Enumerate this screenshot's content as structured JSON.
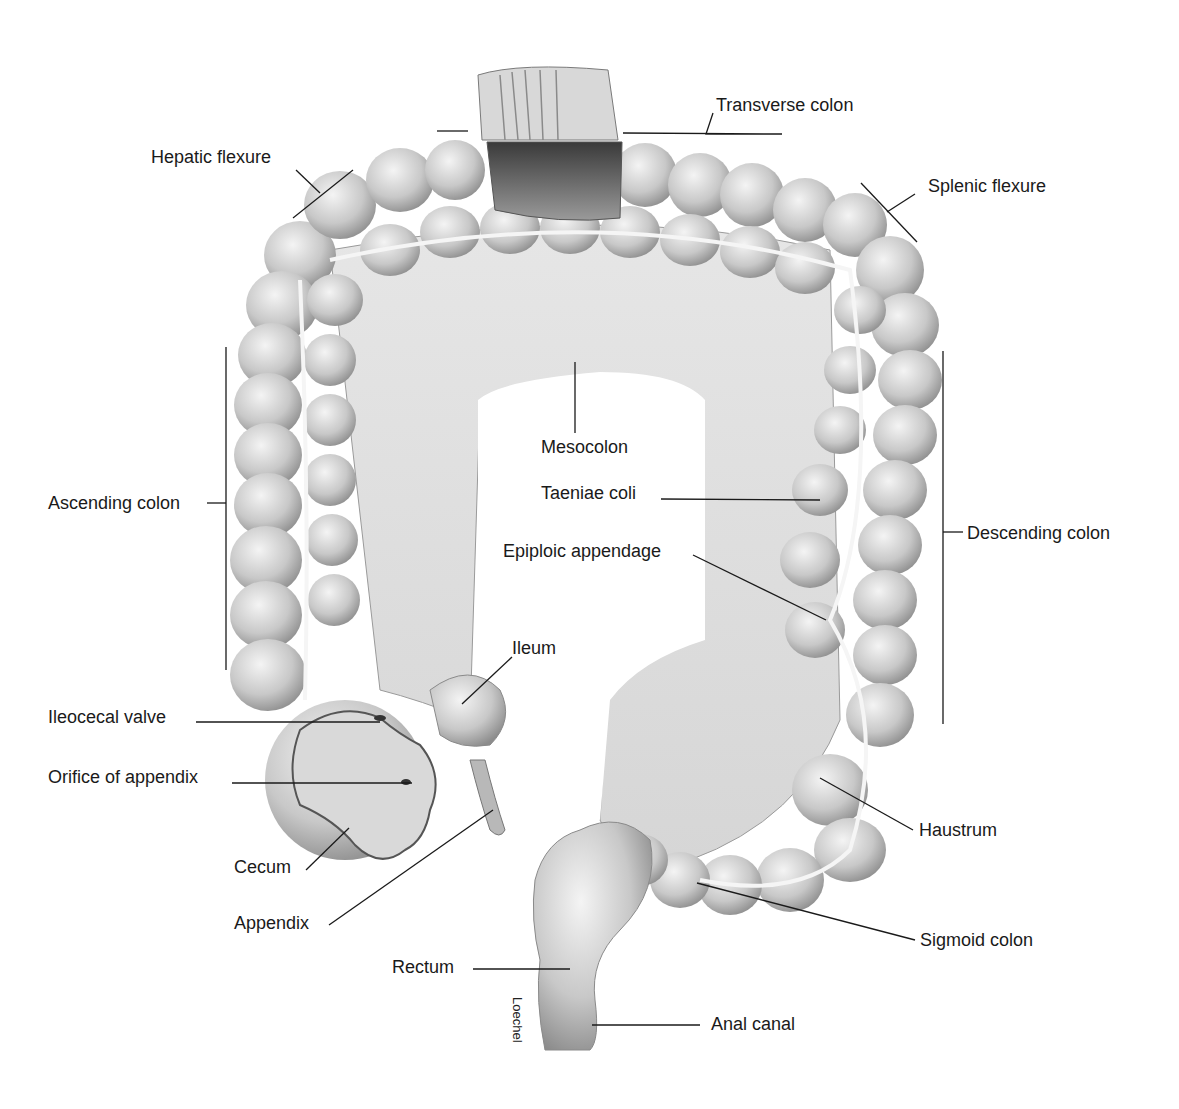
{
  "figure": {
    "credit": "Loechel"
  },
  "labels": {
    "transverse_colon": "Transverse colon",
    "hepatic_flexure": "Hepatic flexure",
    "splenic_flexure": "Splenic flexure",
    "ascending_colon": "Ascending colon",
    "descending_colon": "Descending colon",
    "mesocolon": "Mesocolon",
    "taeniae_coli": "Taeniae coli",
    "epiploic_appendage": "Epiploic appendage",
    "ileum": "Ileum",
    "ileocecal_valve": "Ileocecal valve",
    "orifice_of_appendix": "Orifice of appendix",
    "cecum": "Cecum",
    "appendix": "Appendix",
    "haustrum": "Haustrum",
    "sigmoid_colon": "Sigmoid colon",
    "rectum": "Rectum",
    "anal_canal": "Anal canal"
  },
  "colors": {
    "tissue": "#c9c9c9",
    "tissue_dark": "#8a8a8a",
    "tissue_light": "#ececec",
    "line": "#1a1a1a"
  }
}
